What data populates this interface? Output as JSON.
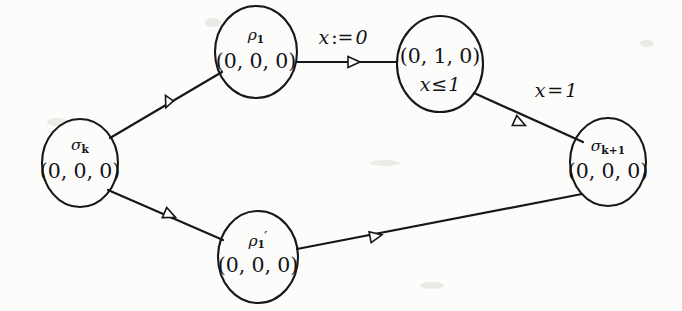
{
  "diagram": {
    "background_color": "#fcfcfb",
    "ink_color": "#17171a",
    "nodes": [
      {
        "id": "sigma-k",
        "name": "σ",
        "subscript": "k",
        "prime": "",
        "vector": "(0, 0, 0)",
        "guard": "",
        "cx": 80,
        "cy": 163,
        "rx": 38,
        "ry": 44
      },
      {
        "id": "rho-1",
        "name": "ρ",
        "subscript": "1",
        "prime": "",
        "vector": "(0, 0, 0)",
        "guard": "",
        "cx": 256,
        "cy": 52,
        "rx": 41,
        "ry": 46
      },
      {
        "id": "region-middle",
        "name": "",
        "subscript": "",
        "prime": "",
        "vector": "(0, 1, 0)",
        "guard_lhs": "x",
        "guard_rel": "≤",
        "guard_rhs": "1",
        "cx": 440,
        "cy": 64,
        "rx": 43,
        "ry": 48
      },
      {
        "id": "sigma-k-plus-1",
        "name": "σ",
        "subscript": "k+1",
        "prime": "",
        "vector": "(0, 0, 0)",
        "guard": "",
        "cx": 608,
        "cy": 162,
        "rx": 38,
        "ry": 44
      },
      {
        "id": "rho-1-prime",
        "name": "ρ",
        "subscript": "1",
        "prime": "′",
        "vector": "(0, 0, 0)",
        "guard": "",
        "cx": 258,
        "cy": 257,
        "rx": 40,
        "ry": 46
      }
    ],
    "edges": [
      {
        "id": "edge-sigmak-to-rho1",
        "from": "sigma-k",
        "to": "rho-1",
        "x1": 110,
        "y1": 138,
        "x2": 222,
        "y2": 72,
        "arrow_x": 170,
        "arrow_y": 103,
        "label": ""
      },
      {
        "id": "edge-rho1-to-region",
        "from": "rho-1",
        "to": "region-middle",
        "x1": 297,
        "y1": 62,
        "x2": 397,
        "y2": 62,
        "arrow_x": 356,
        "arrow_y": 62,
        "label_lhs": "x",
        "label_op": ":=",
        "label_rhs": "0",
        "label_x": 343,
        "label_y": 38
      },
      {
        "id": "edge-region-to-sigmak1",
        "from": "region-middle",
        "to": "sigma-k-plus-1",
        "x1": 474,
        "y1": 93,
        "x2": 583,
        "y2": 142,
        "arrow_x": 521,
        "arrow_y": 121,
        "label_lhs": "x",
        "label_op": "=",
        "label_rhs": "1",
        "label_x": 556,
        "label_y": 91
      },
      {
        "id": "edge-sigmak-to-rho1prime",
        "from": "sigma-k",
        "to": "rho-1-prime",
        "x1": 108,
        "y1": 190,
        "x2": 223,
        "y2": 240,
        "arrow_x": 170,
        "arrow_y": 213,
        "label": ""
      },
      {
        "id": "edge-rho1prime-to-sigmak1",
        "from": "rho-1-prime",
        "to": "sigma-k-plus-1",
        "x1": 297,
        "y1": 249,
        "x2": 582,
        "y2": 194,
        "arrow_x": 376,
        "arrow_y": 235,
        "label": ""
      }
    ]
  }
}
